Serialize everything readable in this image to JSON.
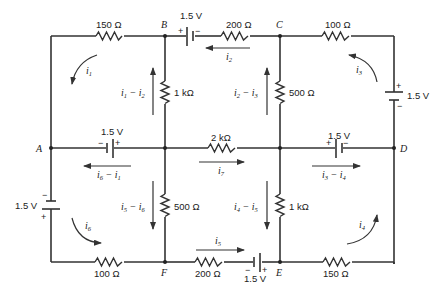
{
  "diagram": {
    "type": "resistor-battery mesh circuit",
    "nodes": {
      "A": "A",
      "B": "B",
      "C": "C",
      "D": "D",
      "E": "E",
      "F": "F"
    },
    "resistors": {
      "r_AB_top": "150 Ω",
      "r_BC_top": "200 Ω",
      "r_CD_top": "100 Ω",
      "r_B_vertical": "1 kΩ",
      "r_C_vertical": "500 Ω",
      "r_middle": "2 kΩ",
      "r_F_vertical": "500 Ω",
      "r_E_vertical": "1 kΩ",
      "r_AF_bottom": "100 Ω",
      "r_FE_bottom": "200 Ω",
      "r_ED_bottom": "150 Ω"
    },
    "batteries": {
      "bat_BC": {
        "label": "1.5 V",
        "plus": "+",
        "minus": "−"
      },
      "bat_right": {
        "label": "1.5 V",
        "plus": "+",
        "minus": "−"
      },
      "bat_A_mid": {
        "label": "1.5 V",
        "plus": "+",
        "minus": "−"
      },
      "bat_D_mid": {
        "label": "1.5 V",
        "plus": "+",
        "minus": "−"
      },
      "bat_left": {
        "label": "1.5 V",
        "plus": "+",
        "minus": "−"
      },
      "bat_FE": {
        "label": "1.5 V",
        "plus": "+",
        "minus": "−"
      }
    },
    "currents": {
      "mesh1": {
        "base": "i",
        "sub": "1"
      },
      "mesh2": {
        "base": "i",
        "sub": "2"
      },
      "mesh3": {
        "base": "i",
        "sub": "3"
      },
      "mesh4": {
        "base": "i",
        "sub": "4"
      },
      "mesh5": {
        "base": "i",
        "sub": "5"
      },
      "mesh6": {
        "base": "i",
        "sub": "6"
      },
      "mesh7": {
        "base": "i",
        "sub": "7"
      },
      "branch_B": {
        "a": "1",
        "b": "2",
        "op": " − "
      },
      "branch_C": {
        "a": "2",
        "b": "3",
        "op": " − "
      },
      "branch_A": {
        "a": "6",
        "b": "1",
        "op": " − "
      },
      "branch_D": {
        "a": "3",
        "b": "4",
        "op": " − "
      },
      "branch_F": {
        "a": "5",
        "b": "6",
        "op": " − "
      },
      "branch_E": {
        "a": "4",
        "b": "5",
        "op": " − "
      }
    }
  }
}
